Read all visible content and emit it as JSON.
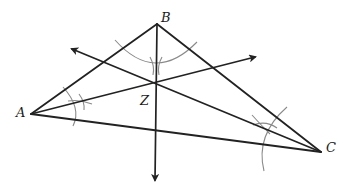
{
  "diagram": {
    "type": "triangle-angle-bisectors-incenter",
    "background": "#ffffff",
    "line_color": "#222222",
    "arc_color": "#8a8a8a",
    "vertices": {
      "A": {
        "label": "A",
        "x": 31,
        "y": 114
      },
      "B": {
        "label": "B",
        "x": 157,
        "y": 24
      },
      "C": {
        "label": "C",
        "x": 321,
        "y": 152
      }
    },
    "intersection": {
      "label": "Z",
      "x": 156,
      "y": 83
    },
    "bisectors": [
      {
        "from": "B",
        "through": "Z",
        "arrow_end": {
          "x": 155,
          "y": 181
        }
      },
      {
        "from": "C",
        "through": "Z",
        "arrow_end": {
          "x": 71,
          "y": 49
        }
      },
      {
        "from": "A",
        "through": "Z",
        "arrow_end": {
          "x": 256,
          "y": 57
        }
      }
    ],
    "labels": {
      "A": "A",
      "B": "B",
      "C": "C",
      "Z": "Z"
    }
  }
}
